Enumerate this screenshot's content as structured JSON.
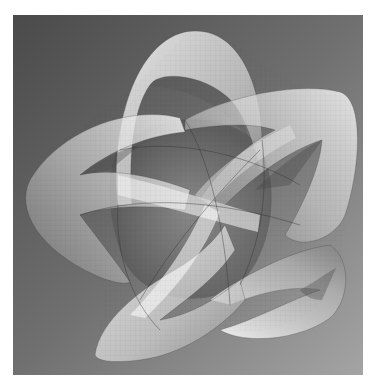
{
  "image": {
    "subject": "rendered translucent five-lobed knotted surface",
    "background": {
      "gradient_start": "#4b4b4b",
      "gradient_end": "#a2a2a2",
      "frame_color": "#ffffff"
    },
    "surface": {
      "fill_light": "#f4f4f4",
      "fill_mid": "#c8c8c8",
      "fill_dark": "#6a6a6a",
      "edge": "#3a3a3a",
      "lobes": [
        "top",
        "right",
        "bottom-right",
        "bottom-left",
        "left"
      ]
    }
  }
}
